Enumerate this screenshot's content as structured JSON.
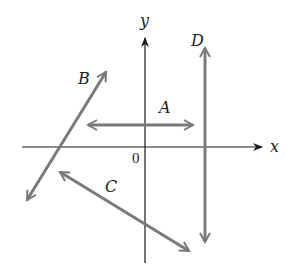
{
  "diagram": {
    "title": "",
    "axes": {
      "x_label": "x",
      "y_label": "y",
      "origin_label": "0",
      "color": "#1a1a1a"
    },
    "vectors": [
      {
        "label": "A",
        "x1": 88,
        "y1": 125,
        "x2": 193,
        "y2": 125,
        "double_headed": true
      },
      {
        "label": "B",
        "x1": 27,
        "y1": 200,
        "x2": 106,
        "y2": 72,
        "double_headed": true
      },
      {
        "label": "C",
        "x1": 60,
        "y1": 172,
        "x2": 189,
        "y2": 251,
        "double_headed": true
      },
      {
        "label": "D",
        "x1": 205,
        "y1": 48,
        "x2": 205,
        "y2": 242,
        "double_headed": true
      }
    ],
    "vector_color": "#7a7a7a"
  }
}
